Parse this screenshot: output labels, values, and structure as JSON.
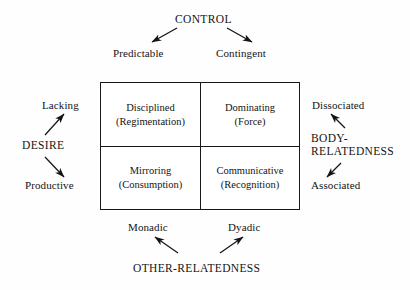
{
  "diagram": {
    "type": "two-axis four-quadrant matrix",
    "axes": [
      {
        "id": "control",
        "name": "CONTROL",
        "position": "top",
        "poles": [
          "Predictable",
          "Contingent"
        ]
      },
      {
        "id": "desire",
        "name": "DESIRE",
        "position": "left",
        "poles": [
          "Lacking",
          "Productive"
        ]
      },
      {
        "id": "body-relatedness",
        "name_line1": "BODY-",
        "name_line2": "RELATEDNESS",
        "position": "right",
        "poles": [
          "Dissociated",
          "Associated"
        ]
      },
      {
        "id": "other-relatedness",
        "name": "OTHER-RELATEDNESS",
        "position": "bottom",
        "poles": [
          "Monadic",
          "Dyadic"
        ]
      }
    ],
    "top_axis": {
      "name": "CONTROL",
      "pole_left": "Predictable",
      "pole_right": "Contingent"
    },
    "left_axis": {
      "name": "DESIRE",
      "pole_top": "Lacking",
      "pole_bottom": "Productive"
    },
    "right_axis": {
      "name_line1": "BODY-",
      "name_line2": "RELATEDNESS",
      "pole_top": "Dissociated",
      "pole_bottom": "Associated"
    },
    "bottom_axis": {
      "name": "OTHER-RELATEDNESS",
      "pole_left": "Monadic",
      "pole_right": "Dyadic"
    },
    "quadrants": [
      {
        "id": "top-left",
        "title": "Disciplined",
        "subtitle": "(Regimentation)"
      },
      {
        "id": "top-right",
        "title": "Dominating",
        "subtitle": "(Force)"
      },
      {
        "id": "bottom-left",
        "title": "Mirroring",
        "subtitle": "(Consumption)"
      },
      {
        "id": "bottom-right",
        "title": "Communicative",
        "subtitle": "(Recognition)"
      }
    ],
    "colors": {
      "background": "#fefefe",
      "ink": "#141414",
      "rule": "#181818"
    }
  }
}
